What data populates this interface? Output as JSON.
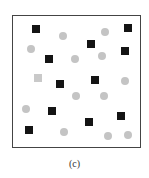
{
  "figure": {
    "caption": "(c)",
    "frame": {
      "left": 12,
      "top": 15,
      "right": 141,
      "bottom": 148,
      "border_color": "#444444"
    },
    "colors": {
      "black_square": "#141414",
      "grey_square": "#c9c9c9",
      "grey_circle": "#c4c4c4"
    },
    "markers": [
      {
        "type": "black-square",
        "x": 36,
        "y": 29
      },
      {
        "type": "grey-circle",
        "x": 63,
        "y": 36
      },
      {
        "type": "grey-circle",
        "x": 105,
        "y": 32
      },
      {
        "type": "black-square",
        "x": 128,
        "y": 28
      },
      {
        "type": "grey-circle",
        "x": 31,
        "y": 49
      },
      {
        "type": "black-square",
        "x": 91,
        "y": 44
      },
      {
        "type": "black-square",
        "x": 125,
        "y": 51
      },
      {
        "type": "black-square",
        "x": 49,
        "y": 59
      },
      {
        "type": "grey-circle",
        "x": 75,
        "y": 59
      },
      {
        "type": "grey-circle",
        "x": 102,
        "y": 56
      },
      {
        "type": "grey-square",
        "x": 38,
        "y": 78
      },
      {
        "type": "black-square",
        "x": 60,
        "y": 84
      },
      {
        "type": "black-square",
        "x": 95,
        "y": 80
      },
      {
        "type": "grey-circle",
        "x": 125,
        "y": 81
      },
      {
        "type": "grey-circle",
        "x": 76,
        "y": 96
      },
      {
        "type": "grey-circle",
        "x": 104,
        "y": 96
      },
      {
        "type": "grey-circle",
        "x": 26,
        "y": 109
      },
      {
        "type": "black-square",
        "x": 52,
        "y": 111
      },
      {
        "type": "black-square",
        "x": 89,
        "y": 122
      },
      {
        "type": "black-square",
        "x": 121,
        "y": 116
      },
      {
        "type": "black-square",
        "x": 29,
        "y": 130
      },
      {
        "type": "grey-circle",
        "x": 64,
        "y": 132
      },
      {
        "type": "grey-circle",
        "x": 108,
        "y": 136
      },
      {
        "type": "grey-circle",
        "x": 128,
        "y": 135
      }
    ]
  }
}
